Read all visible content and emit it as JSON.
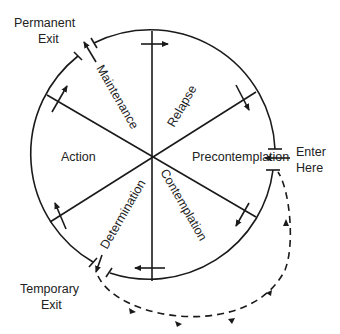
{
  "diagram": {
    "stages": [
      {
        "id": "precontemplation",
        "label": "Precontemplation"
      },
      {
        "id": "contemplation",
        "label": "Contemplation"
      },
      {
        "id": "determination",
        "label": "Determination"
      },
      {
        "id": "action",
        "label": "Action"
      },
      {
        "id": "maintenance",
        "label": "Maintenance"
      },
      {
        "id": "relapse",
        "label": "Relapse"
      }
    ],
    "external_labels": {
      "permanent_exit": [
        "Permanent",
        "Exit"
      ],
      "enter_here": [
        "Enter",
        "Here"
      ],
      "temporary_exit": [
        "Temporary",
        "Exit"
      ]
    },
    "flow_direction": "clockwise",
    "colors": {
      "line": "#1a1a1a",
      "text": "#222222",
      "background": "#ffffff"
    }
  }
}
